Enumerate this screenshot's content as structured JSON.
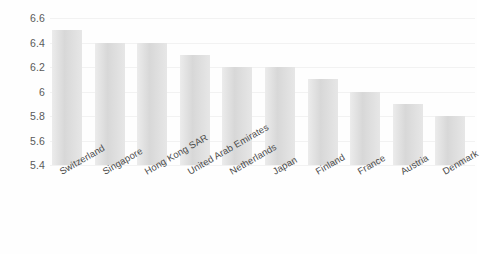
{
  "chart_data": {
    "type": "bar",
    "title": "",
    "subtitle": "",
    "xlabel": "",
    "ylabel": "",
    "categories": [
      "Switzerland",
      "Singapore",
      "Hong Kong SAR",
      "United Arab Emirates",
      "Netherlands",
      "Japan",
      "Finland",
      "France",
      "Austria",
      "Denmark"
    ],
    "values": [
      6.5,
      6.4,
      6.4,
      6.3,
      6.2,
      6.2,
      6.1,
      6.0,
      5.9,
      5.8
    ],
    "ylim": [
      5.4,
      6.6
    ],
    "yticks": [
      "6.6",
      "6.4",
      "6.2",
      "6",
      "5.8",
      "5.6",
      "5.4"
    ],
    "ytick_values": [
      6.6,
      6.4,
      6.2,
      6.0,
      5.8,
      5.6,
      5.4
    ],
    "grid": true,
    "legend": "none",
    "bar_color": "#dcdcdc",
    "gridline_color": "#f2f2f2",
    "tick_label_color": "#5a5a5a",
    "background_color": "#fefefe",
    "xtick_rotation": -30
  }
}
